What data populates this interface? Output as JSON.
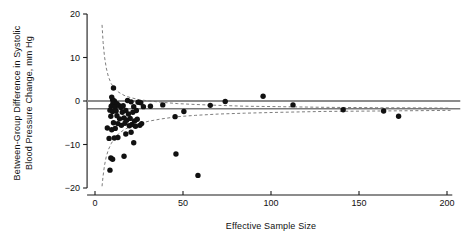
{
  "chart_data": {
    "type": "scatter",
    "title": "",
    "xlabel": "Effective Sample Size",
    "ylabel": "Between-Group Difference in Systolic Blood Pressure Change, mm Hg",
    "ylabel_line1": "Between-Group Difference in Systolic",
    "ylabel_line2": "Blood Pressure Change, mm Hg",
    "xlim": [
      -8,
      206
    ],
    "ylim": [
      -21,
      21
    ],
    "xticks": [
      0,
      50,
      100,
      150,
      200
    ],
    "xtick_labels": [
      "0",
      "50",
      "100",
      "150",
      "200"
    ],
    "yticks": [
      20,
      10,
      0,
      -10,
      -20
    ],
    "ytick_labels": [
      "20",
      "10",
      "0",
      "-10",
      "-20"
    ],
    "grid": false,
    "legend": "none",
    "reference_lines": [
      {
        "name": "null-effect-line",
        "y": 0,
        "color": "#8c8c8c",
        "width": 2.2,
        "style": "solid"
      },
      {
        "name": "pooled-estimate-line",
        "y": -1.8,
        "color": "#3a3a3a",
        "width": 1.0,
        "style": "solid"
      }
    ],
    "funnel": {
      "name": "pseudo-95-confidence-limits",
      "center": -1.8,
      "style": "dashed",
      "color": "#6e6e6e",
      "upper": [
        [
          4.0,
          17.5
        ],
        [
          4.6,
          13.5
        ],
        [
          5.4,
          10.2
        ],
        [
          6.4,
          7.6
        ],
        [
          7.6,
          5.6
        ],
        [
          9.2,
          4.0
        ],
        [
          11.0,
          2.9
        ],
        [
          13.5,
          2.0
        ],
        [
          16.5,
          1.3
        ],
        [
          20.0,
          0.8
        ],
        [
          25.0,
          0.3
        ],
        [
          31.0,
          0.0
        ],
        [
          38.0,
          -0.3
        ],
        [
          47.0,
          -0.6
        ],
        [
          57.0,
          -0.8
        ],
        [
          70.0,
          -1.0
        ],
        [
          85.0,
          -1.2
        ],
        [
          105.0,
          -1.3
        ],
        [
          130.0,
          -1.45
        ],
        [
          160.0,
          -1.55
        ],
        [
          190.0,
          -1.6
        ],
        [
          202.0,
          -1.65
        ]
      ],
      "lower": [
        [
          4.0,
          -19.6
        ],
        [
          4.6,
          -17.2
        ],
        [
          5.4,
          -14.8
        ],
        [
          6.4,
          -12.8
        ],
        [
          7.6,
          -11.2
        ],
        [
          9.2,
          -9.8
        ],
        [
          11.0,
          -8.6
        ],
        [
          13.5,
          -7.5
        ],
        [
          16.5,
          -6.6
        ],
        [
          20.0,
          -5.9
        ],
        [
          25.0,
          -5.2
        ],
        [
          31.0,
          -4.6
        ],
        [
          38.0,
          -4.1
        ],
        [
          47.0,
          -3.6
        ],
        [
          57.0,
          -3.3
        ],
        [
          70.0,
          -3.0
        ],
        [
          85.0,
          -2.8
        ],
        [
          105.0,
          -2.6
        ],
        [
          130.0,
          -2.4
        ],
        [
          160.0,
          -2.3
        ],
        [
          190.0,
          -2.2
        ],
        [
          202.0,
          -2.15
        ]
      ]
    },
    "points": [
      [
        10.5,
        3.0
      ],
      [
        9.5,
        0.9
      ],
      [
        10.0,
        0.3
      ],
      [
        11.0,
        0.0
      ],
      [
        10.2,
        -0.5
      ],
      [
        12.5,
        -0.6
      ],
      [
        9.2,
        -1.2
      ],
      [
        11.5,
        -1.4
      ],
      [
        13.5,
        -1.0
      ],
      [
        14.8,
        -1.5
      ],
      [
        16.0,
        -1.1
      ],
      [
        18.5,
        0.1
      ],
      [
        20.5,
        -0.2
      ],
      [
        22.0,
        -1.3
      ],
      [
        24.5,
        -0.3
      ],
      [
        26.0,
        -0.4
      ],
      [
        27.5,
        -1.3
      ],
      [
        31.5,
        -1.2
      ],
      [
        8.5,
        -2.1
      ],
      [
        10.0,
        -2.4
      ],
      [
        12.0,
        -2.3
      ],
      [
        15.5,
        -2.6
      ],
      [
        17.5,
        -2.2
      ],
      [
        19.0,
        -3.0
      ],
      [
        21.5,
        -2.6
      ],
      [
        23.5,
        -2.2
      ],
      [
        9.0,
        -3.5
      ],
      [
        12.5,
        -3.4
      ],
      [
        14.0,
        -4.1
      ],
      [
        16.5,
        -3.9
      ],
      [
        18.0,
        -4.4
      ],
      [
        20.0,
        -4.0
      ],
      [
        22.5,
        -4.6
      ],
      [
        24.0,
        -4.2
      ],
      [
        10.5,
        -5.0
      ],
      [
        13.0,
        -5.2
      ],
      [
        15.0,
        -5.6
      ],
      [
        17.0,
        -5.1
      ],
      [
        19.5,
        -5.7
      ],
      [
        21.0,
        -5.4
      ],
      [
        23.0,
        -5.8
      ],
      [
        25.5,
        -5.6
      ],
      [
        26.5,
        -5.2
      ],
      [
        7.0,
        -6.2
      ],
      [
        9.5,
        -6.6
      ],
      [
        11.5,
        -6.3
      ],
      [
        8.0,
        -8.6
      ],
      [
        11.0,
        -8.5
      ],
      [
        13.0,
        -8.4
      ],
      [
        17.5,
        -7.6
      ],
      [
        20.5,
        -7.2
      ],
      [
        22.0,
        -9.6
      ],
      [
        9.0,
        -13.1
      ],
      [
        10.0,
        -13.4
      ],
      [
        16.5,
        -12.7
      ],
      [
        8.5,
        -15.9
      ],
      [
        46.0,
        -12.2
      ],
      [
        58.5,
        -17.1
      ],
      [
        45.5,
        -3.6
      ],
      [
        50.5,
        -2.4
      ],
      [
        38.5,
        -0.9
      ],
      [
        65.5,
        -1.0
      ],
      [
        74.0,
        -0.1
      ],
      [
        95.5,
        1.1
      ],
      [
        112.5,
        -0.9
      ],
      [
        141.0,
        -2.0
      ],
      [
        164.0,
        -2.3
      ],
      [
        172.5,
        -3.5
      ]
    ]
  },
  "axes": {
    "y_axis_name": "y-axis",
    "x_axis_name": "x-axis"
  }
}
